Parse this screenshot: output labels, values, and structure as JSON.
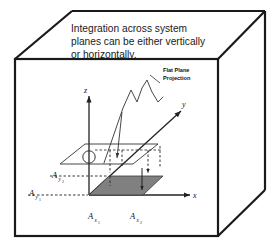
{
  "figure": {
    "caption": {
      "line1": "Integration across system",
      "line2": "planes can be either vertically",
      "line3": "or horizontally."
    },
    "annotation": {
      "line1": "Flat Plane",
      "line2": "Projection"
    },
    "axes": {
      "z": "z",
      "y": "y",
      "x": "x"
    },
    "area_labels": {
      "y2": {
        "base": "A",
        "sub": "y",
        "subsub": "2"
      },
      "y1": {
        "base": "A",
        "sub": "y",
        "subsub": "1"
      },
      "x1": {
        "base": "A",
        "sub": "x",
        "subsub": "1"
      },
      "x2": {
        "base": "A",
        "sub": "x",
        "subsub": "2"
      }
    },
    "colors": {
      "outline": "#1a1a1a",
      "shaded_plane_fill": "#808080",
      "background": "#ffffff",
      "line": "#333333"
    }
  }
}
